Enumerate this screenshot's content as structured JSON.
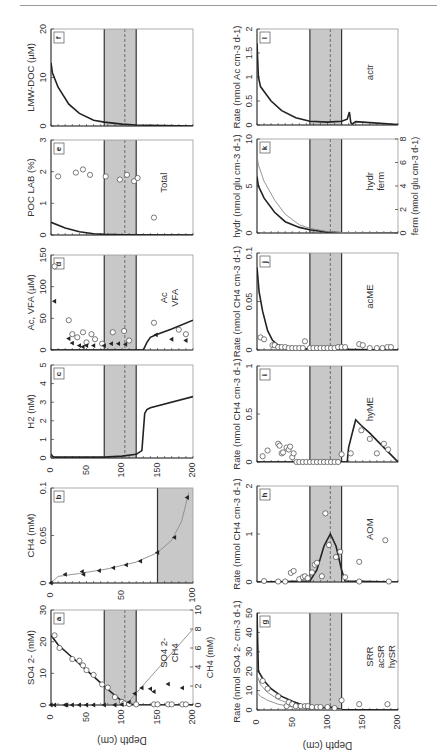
{
  "figure": {
    "orientation": "rotated-90-ccw",
    "depth_axis_label": "Depth (cm)",
    "depth_ticks": [
      0,
      50,
      100,
      150,
      200
    ],
    "smtz_band": {
      "top_cm": 75,
      "bottom_cm": 120,
      "center_cm": 104,
      "fill": "#c8c8c8"
    },
    "colors": {
      "line": "#222222",
      "thin_line": "#8a8a8a",
      "band": "#c8c8c8",
      "frame": "#555555",
      "marker_fill": "#ffffff"
    }
  },
  "panels": {
    "a": {
      "letter": "a",
      "ylabel": "SO4 2- (mM)",
      "ylabel2": "CH4 (mM)",
      "legend": [
        "SO4 2-",
        "CH4"
      ]
    },
    "b": {
      "letter": "b",
      "ylabel": "CH4 (mM)",
      "depth_max": 100
    },
    "c": {
      "letter": "c",
      "ylabel": "H2 (nM)"
    },
    "d": {
      "letter": "d",
      "ylabel": "Ac, VFA (µM)",
      "legend": [
        "Ac",
        "VFA"
      ]
    },
    "e": {
      "letter": "e",
      "ylabel": "POC LAB (%)",
      "legend": [
        "Total"
      ]
    },
    "f": {
      "letter": "f",
      "ylabel": "LMW-DOC (µM)"
    },
    "g": {
      "letter": "g",
      "ylabel": "Rate (nmol SO4 2- cm-3 d-1)",
      "legend": [
        "SRR",
        "acSR",
        "hySR"
      ]
    },
    "h": {
      "letter": "h",
      "ylabel": "Rate (nmol CH4 cm-3 d-1)",
      "legend": [
        "AOM"
      ]
    },
    "i": {
      "letter": "i",
      "ylabel": "Rate (nmol CH4 cm-3 d-1)",
      "legend": [
        "hyME"
      ]
    },
    "j": {
      "letter": "j",
      "ylabel": "Rate (nmol CH4 cm-3 d-1)",
      "legend": [
        "acME"
      ]
    },
    "k": {
      "letter": "k",
      "ylabel": "hydr (nmol glu cm-3 d-1)",
      "ylabel2": "ferm (nmol glu cm-3 d-1)",
      "legend": [
        "hydr",
        "ferm"
      ]
    },
    "l": {
      "letter": "l",
      "ylabel": "Rate (nmol Ac cm-3 d-1)",
      "legend": [
        "actr"
      ]
    }
  },
  "chart_data": [
    {
      "panel": "a",
      "type": "scatter",
      "title": "",
      "xlabel": "Depth (cm)",
      "ylabel": "SO4 2- (mM)",
      "ylim": [
        0,
        30
      ],
      "y2label": "CH4 (mM)",
      "y2lim": [
        0,
        10
      ],
      "series": [
        {
          "name": "SO4 2- (measured)",
          "marker": "circle",
          "x": [
            5,
            12,
            30,
            40,
            45,
            50,
            60,
            72,
            80,
            90,
            100,
            103,
            110,
            120,
            145,
            150,
            165,
            170,
            185,
            190
          ],
          "y": [
            22,
            18,
            14.5,
            14,
            12.5,
            11,
            9.5,
            6.5,
            5.5,
            2.5,
            1,
            0.5,
            0.3,
            0.2,
            0.2,
            0.2,
            0.2,
            0.2,
            0.2,
            0.2
          ]
        },
        {
          "name": "SO4 2- (model)",
          "line": "thick",
          "x": [
            0,
            10,
            30,
            50,
            70,
            90,
            100,
            105,
            110,
            120,
            200
          ],
          "y": [
            22,
            19,
            15,
            11,
            7,
            3,
            1.2,
            0.5,
            0.2,
            0.05,
            0
          ]
        },
        {
          "name": "CH4 (measured)",
          "marker": "triangle",
          "axis": "y2",
          "x": [
            0,
            5,
            20,
            22,
            30,
            40,
            50,
            60,
            75,
            90,
            100,
            110,
            118,
            128,
            140,
            145,
            165,
            185
          ],
          "y": [
            0,
            0,
            0,
            0,
            0,
            0,
            0,
            0,
            0,
            0,
            0.05,
            0.3,
            1.2,
            1.8,
            1.7,
            1.4,
            2.2,
            1.8
          ]
        },
        {
          "name": "CH4 (model)",
          "line": "thin",
          "axis": "y2",
          "x": [
            0,
            100,
            110,
            200
          ],
          "y": [
            0,
            0,
            0.4,
            8
          ]
        }
      ]
    },
    {
      "panel": "b",
      "type": "scatter",
      "xlabel": "Depth (cm)",
      "xlim": [
        0,
        100
      ],
      "ylabel": "CH4 (mM)",
      "ylim": [
        0,
        0.1
      ],
      "series": [
        {
          "name": "CH4 (measured)",
          "marker": "triangle",
          "x": [
            0,
            10,
            22,
            23,
            34,
            44,
            53,
            63,
            75,
            87,
            96
          ],
          "y": [
            0,
            0.009,
            0.012,
            0.009,
            0.013,
            0.016,
            0.019,
            0.023,
            0.032,
            0.048,
            0.09
          ]
        },
        {
          "name": "CH4 (model)",
          "line": "thin",
          "x": [
            0,
            5,
            20,
            40,
            60,
            75,
            85,
            92,
            97
          ],
          "y": [
            0,
            0.007,
            0.01,
            0.015,
            0.022,
            0.032,
            0.045,
            0.065,
            0.095
          ]
        }
      ],
      "band": {
        "from": 75,
        "to": 100
      }
    },
    {
      "panel": "c",
      "type": "line",
      "xlabel": "Depth (cm)",
      "ylabel": "H2 (nM)",
      "ylim": [
        0,
        5
      ],
      "series": [
        {
          "name": "H2 (model)",
          "x": [
            0,
            2,
            5,
            75,
            100,
            120,
            128,
            132,
            135,
            140,
            200
          ],
          "y": [
            0.2,
            0.1,
            0.05,
            0.05,
            0.1,
            0.2,
            0.4,
            2.4,
            2.6,
            2.7,
            3.3
          ]
        }
      ]
    },
    {
      "panel": "d",
      "type": "scatter",
      "xlabel": "Depth (cm)",
      "ylabel": "Ac, VFA (µM)",
      "ylim": [
        0,
        150
      ],
      "series": [
        {
          "name": "VFA",
          "marker": "circle",
          "x": [
            5,
            25,
            30,
            37,
            45,
            50,
            57,
            62,
            72,
            87,
            103,
            110,
            145,
            180,
            190
          ],
          "y": [
            132,
            47,
            25,
            20,
            28,
            12,
            25,
            17,
            10,
            28,
            30,
            15,
            43,
            32,
            25
          ]
        },
        {
          "name": "Ac",
          "marker": "triangle",
          "x": [
            5,
            25,
            30,
            40,
            45,
            50,
            60,
            75,
            85,
            95,
            105,
            148,
            170,
            190
          ],
          "y": [
            77,
            18,
            11,
            7,
            5,
            7,
            7,
            7,
            10,
            10,
            9,
            24,
            17,
            15
          ]
        },
        {
          "name": "Ac (model)",
          "line": "thick",
          "x": [
            0,
            130,
            135,
            140,
            148,
            170,
            200
          ],
          "y": [
            0,
            0,
            12,
            20,
            24,
            33,
            47
          ]
        }
      ]
    },
    {
      "panel": "e",
      "type": "scatter",
      "xlabel": "Depth (cm)",
      "ylabel": "POC LAB (%)",
      "ylim": [
        0,
        3
      ],
      "series": [
        {
          "name": "Total",
          "marker": "circle",
          "x": [
            10,
            35,
            45,
            55,
            77,
            97,
            107,
            117,
            122,
            145
          ],
          "y": [
            1.85,
            1.97,
            2.07,
            1.9,
            1.85,
            1.75,
            1.9,
            1.7,
            1.8,
            0.55
          ]
        },
        {
          "name": "model",
          "line": "thick",
          "x": [
            0,
            20,
            40,
            60,
            75,
            100,
            200
          ],
          "y": [
            0.4,
            0.22,
            0.1,
            0.04,
            0.02,
            0.01,
            0
          ]
        }
      ]
    },
    {
      "panel": "f",
      "type": "line",
      "xlabel": "Depth (cm)",
      "ylabel": "LMW-DOC (µM)",
      "ylim": [
        0,
        20
      ],
      "series": [
        {
          "name": "LMW-DOC (model)",
          "x": [
            0,
            2,
            10,
            25,
            40,
            60,
            75,
            100,
            120,
            200
          ],
          "y": [
            13,
            11,
            8,
            4.5,
            2.6,
            1.2,
            0.8,
            0.4,
            0.2,
            0
          ]
        }
      ]
    },
    {
      "panel": "g",
      "type": "scatter",
      "xlabel": "Depth (cm)",
      "ylabel": "Rate (nmol SO4 2- cm-3 d-1)",
      "ylim": [
        0,
        50
      ],
      "series": [
        {
          "name": "SRR",
          "marker": "circle",
          "x": [
            8,
            15,
            30,
            42,
            45,
            50,
            55,
            62,
            68,
            72,
            78,
            85,
            90,
            100,
            110,
            120,
            145,
            185
          ],
          "y": [
            15,
            11,
            7,
            2,
            4,
            3,
            2,
            2,
            2,
            2,
            1.5,
            1.5,
            1.5,
            1.5,
            1,
            5,
            3,
            3
          ]
        },
        {
          "name": "total (model)",
          "line": "thick",
          "x": [
            0,
            2,
            10,
            20,
            35,
            50,
            65,
            75,
            90,
            104,
            120,
            200
          ],
          "y": [
            50,
            20,
            15,
            11,
            7,
            4.5,
            2.5,
            1.5,
            1,
            1.5,
            0.2,
            0
          ]
        },
        {
          "name": "acSR",
          "line": "thin",
          "x": [
            0,
            5,
            15,
            30,
            50,
            75,
            100,
            120
          ],
          "y": [
            18,
            13,
            9,
            5.5,
            2.8,
            1.2,
            0.7,
            0
          ]
        },
        {
          "name": "hySR",
          "line": "thin",
          "x": [
            0,
            5,
            15,
            30,
            50,
            75,
            100,
            120
          ],
          "y": [
            9,
            7,
            5,
            3,
            1.6,
            0.7,
            0.4,
            0
          ]
        }
      ]
    },
    {
      "panel": "h",
      "type": "scatter",
      "xlabel": "Depth (cm)",
      "ylabel": "Rate (nmol CH4 cm-3 d-1)",
      "ylim": [
        0,
        2
      ],
      "series": [
        {
          "name": "AOM",
          "marker": "circle",
          "x": [
            10,
            30,
            40,
            48,
            52,
            60,
            65,
            68,
            72,
            78,
            82,
            85,
            92,
            97,
            102,
            112,
            118,
            125,
            145,
            145,
            182,
            187
          ],
          "y": [
            0.02,
            0.01,
            0.01,
            0.19,
            0.23,
            0.06,
            0.1,
            0.12,
            0.08,
            0.2,
            0.36,
            0.4,
            0.12,
            1.43,
            0.77,
            0.52,
            0.63,
            0.1,
            0.42,
            0.01,
            0.87,
            0.01
          ]
        },
        {
          "name": "AOM (model)",
          "line": "thick",
          "x": [
            0,
            75,
            85,
            95,
            104,
            112,
            120,
            125,
            200
          ],
          "y": [
            0,
            0.02,
            0.25,
            0.75,
            1.0,
            0.75,
            0.25,
            0.02,
            0
          ]
        }
      ]
    },
    {
      "panel": "i",
      "type": "scatter",
      "xlabel": "Depth (cm)",
      "ylabel": "Rate (nmol CH4 cm-3 d-1)",
      "ylim": [
        0,
        1
      ],
      "series": [
        {
          "name": "hyME",
          "marker": "circle",
          "x": [
            8,
            15,
            30,
            32,
            35,
            37,
            42,
            45,
            47,
            50,
            52,
            56,
            120,
            133,
            148,
            160,
            170,
            180,
            186
          ],
          "y": [
            0.06,
            0.12,
            0.19,
            0.17,
            0.09,
            0.1,
            0.15,
            0.13,
            0.16,
            0.05,
            0.09,
            0.0,
            0.08,
            0.09,
            0.33,
            0.24,
            0.09,
            0.19,
            0.13
          ]
        },
        {
          "name": "hyME zero points",
          "marker": "circle",
          "x": [
            60,
            65,
            70,
            75,
            80,
            85,
            90,
            95,
            100,
            105,
            110,
            115
          ],
          "y": [
            0,
            0,
            0,
            0,
            0,
            0,
            0,
            0,
            0,
            0,
            0,
            0
          ]
        },
        {
          "name": "hyME (model)",
          "line": "thick",
          "x": [
            0,
            128,
            130,
            135,
            140,
            148,
            160,
            180,
            200
          ],
          "y": [
            0,
            0,
            0.15,
            0.3,
            0.44,
            0.38,
            0.3,
            0.15,
            0
          ]
        }
      ]
    },
    {
      "panel": "j",
      "type": "scatter",
      "xlabel": "Depth (cm)",
      "ylabel": "Rate (nmol CH4 cm-3 d-1)",
      "ylim": [
        0,
        0.1
      ],
      "series": [
        {
          "name": "acME",
          "marker": "circle",
          "x": [
            5,
            10,
            22,
            25,
            30,
            35,
            40,
            45,
            50,
            55,
            60,
            65,
            68,
            75,
            80,
            85,
            90,
            95,
            100,
            105,
            110,
            115,
            120,
            125,
            145,
            150,
            160,
            170,
            178,
            185,
            190
          ],
          "y": [
            0.013,
            0.011,
            0.005,
            0.005,
            0.003,
            0.003,
            0.003,
            0.002,
            0.002,
            0.002,
            0.002,
            0.002,
            0.009,
            0.002,
            0.002,
            0.002,
            0.002,
            0.002,
            0.002,
            0.002,
            0.002,
            0.003,
            0.003,
            0.003,
            0.006,
            0.005,
            0.002,
            0.002,
            0.002,
            0.003,
            0.003
          ]
        },
        {
          "name": "acME (model)",
          "line": "thick",
          "x": [
            0,
            3,
            8,
            15,
            22,
            30,
            50,
            75,
            200
          ],
          "y": [
            0.085,
            0.06,
            0.04,
            0.02,
            0.01,
            0.005,
            0.002,
            0.001,
            0
          ]
        }
      ]
    },
    {
      "panel": "k",
      "type": "line",
      "xlabel": "Depth (cm)",
      "ylabel": "hydr (nmol glu cm-3 d-1)",
      "ylim": [
        0,
        10
      ],
      "y2label": "ferm (nmol glu cm-3 d-1)",
      "y2lim": [
        0,
        8
      ],
      "series": [
        {
          "name": "hydr",
          "line": "thick",
          "x": [
            0,
            2,
            10,
            25,
            40,
            60,
            75,
            100,
            120,
            200
          ],
          "y": [
            6,
            5,
            3.7,
            2.2,
            1.2,
            0.6,
            0.35,
            0.1,
            0.03,
            0
          ]
        },
        {
          "name": "ferm",
          "line": "thin",
          "axis": "y2",
          "x": [
            0,
            2,
            10,
            25,
            40,
            60,
            75,
            100,
            120,
            200
          ],
          "y": [
            6.6,
            5.8,
            4.4,
            2.8,
            1.6,
            0.7,
            0.4,
            0.12,
            0.04,
            0
          ]
        }
      ]
    },
    {
      "panel": "l",
      "type": "line",
      "xlabel": "Depth (cm)",
      "ylabel": "Rate (nmol Ac cm-3 d-1)",
      "ylim": [
        0,
        2
      ],
      "series": [
        {
          "name": "actr",
          "line": "thick",
          "x": [
            0,
            2,
            5,
            10,
            20,
            35,
            55,
            75,
            100,
            120,
            128,
            131,
            133,
            135,
            140,
            160,
            200
          ],
          "y": [
            1.7,
            1.0,
            0.8,
            0.7,
            0.5,
            0.3,
            0.15,
            0.08,
            0.06,
            0.08,
            0.12,
            0.27,
            0.05,
            0.02,
            0.07,
            0.05,
            0.01
          ]
        }
      ]
    }
  ]
}
